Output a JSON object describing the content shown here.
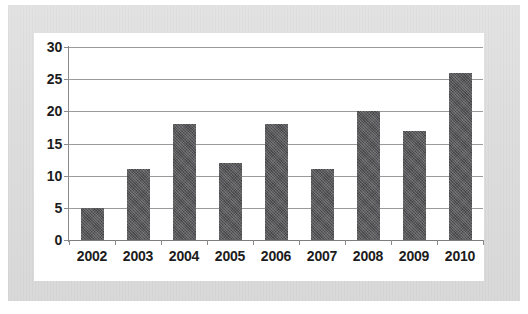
{
  "chart_data": {
    "type": "bar",
    "title": "",
    "subtitle": "",
    "xlabel": "",
    "ylabel": "",
    "categories": [
      "2002",
      "2003",
      "2004",
      "2005",
      "2006",
      "2007",
      "2008",
      "2009",
      "2010"
    ],
    "values": [
      5,
      11,
      18,
      12,
      18,
      11,
      20,
      17,
      26
    ],
    "ylim": [
      0,
      30
    ],
    "yticks": [
      0,
      5,
      10,
      15,
      20,
      25,
      30
    ],
    "ytick_labels": [
      "0",
      "5",
      "10",
      "15",
      "20",
      "25",
      "30"
    ],
    "grid": true,
    "legend": false,
    "legend_position": "none",
    "annotations": [],
    "bar_color": "#58585a",
    "gridline_color": "#9a9a9a",
    "axis_color": "#8a8a8a",
    "panel_background": "#ffffff",
    "page_background": "#dedede",
    "label_color": "#1c1c1c"
  }
}
